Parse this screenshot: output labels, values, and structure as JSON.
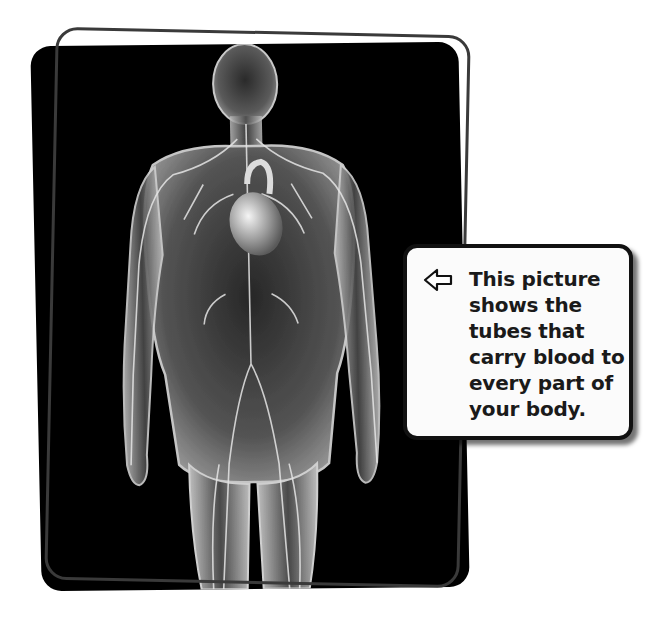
{
  "image": {
    "description": "Translucent human body figure showing the circulatory system (heart, arteries and veins) on a black background inside a tilted rounded frame",
    "background_color": "#000000",
    "frame_outline_color": "#3a3a3a",
    "figure_tint": "#d9d9d9"
  },
  "callout": {
    "arrow_icon": "left-arrow-outline-icon",
    "lines": [
      "This picture",
      "shows the",
      "tubes that",
      "carry blood to",
      "every part of",
      "your body."
    ],
    "text": "This picture shows the tubes that carry blood to every part of your body.",
    "border_color": "#111111",
    "background_color": "#fbfbfb"
  }
}
